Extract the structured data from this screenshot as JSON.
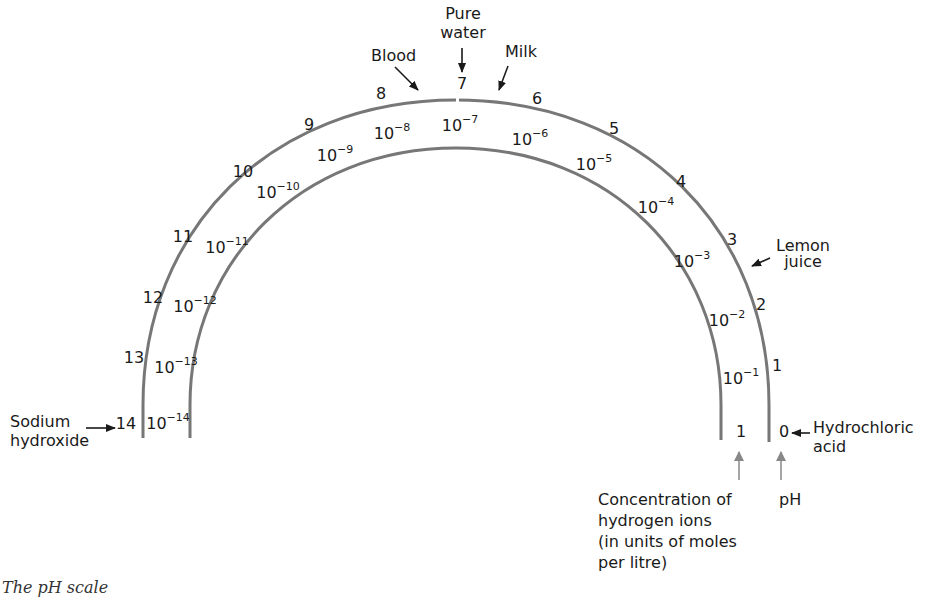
{
  "diagram": {
    "title_caption": "The pH scale",
    "scale_colors": {
      "arc": "#777777",
      "text": "#1a1a1a",
      "pointer_arrow": "#1a1a1a",
      "axis_arrow": "#888888"
    },
    "ph_scale": [
      {
        "ph": "14",
        "x": 126,
        "y": 424
      },
      {
        "ph": "13",
        "x": 134,
        "y": 358
      },
      {
        "ph": "12",
        "x": 153,
        "y": 298
      },
      {
        "ph": "11",
        "x": 183,
        "y": 237
      },
      {
        "ph": "10",
        "x": 243,
        "y": 172
      },
      {
        "ph": "9",
        "x": 309,
        "y": 125
      },
      {
        "ph": "8",
        "x": 381,
        "y": 94
      },
      {
        "ph": "7",
        "x": 462,
        "y": 84
      },
      {
        "ph": "6",
        "x": 537,
        "y": 99
      },
      {
        "ph": "5",
        "x": 614,
        "y": 129
      },
      {
        "ph": "4",
        "x": 681,
        "y": 182
      },
      {
        "ph": "3",
        "x": 732,
        "y": 240
      },
      {
        "ph": "2",
        "x": 761,
        "y": 305
      },
      {
        "ph": "1",
        "x": 777,
        "y": 366
      },
      {
        "ph": "0",
        "x": 784,
        "y": 432
      }
    ],
    "concentration_scale": [
      {
        "base": "10",
        "exp": "−14",
        "x": 168,
        "y": 422
      },
      {
        "base": "10",
        "exp": "−13",
        "x": 176,
        "y": 368
      },
      {
        "base": "10",
        "exp": "−12",
        "x": 195,
        "y": 306
      },
      {
        "base": "10",
        "exp": "−11",
        "x": 226,
        "y": 247
      },
      {
        "base": "10",
        "exp": "−10",
        "x": 277,
        "y": 192
      },
      {
        "base": "10",
        "exp": "−9",
        "x": 335,
        "y": 155
      },
      {
        "base": "10",
        "exp": "−8",
        "x": 392,
        "y": 133
      },
      {
        "base": "10",
        "exp": "−7",
        "x": 460,
        "y": 125
      },
      {
        "base": "10",
        "exp": "−6",
        "x": 530,
        "y": 139
      },
      {
        "base": "10",
        "exp": "−5",
        "x": 594,
        "y": 164
      },
      {
        "base": "10",
        "exp": "−4",
        "x": 656,
        "y": 207
      },
      {
        "base": "10",
        "exp": "−3",
        "x": 692,
        "y": 261
      },
      {
        "base": "10",
        "exp": "−2",
        "x": 727,
        "y": 320
      },
      {
        "base": "10",
        "exp": "−1",
        "x": 741,
        "y": 378
      },
      {
        "base": "1",
        "exp": "",
        "x": 741,
        "y": 432
      }
    ],
    "substances": {
      "sodium_hydroxide": {
        "line1": "Sodium",
        "line2": "hydroxide"
      },
      "blood": "Blood",
      "pure_water": {
        "line1": "Pure",
        "line2": "water"
      },
      "milk": "Milk",
      "lemon_juice": {
        "line1": "Lemon",
        "line2": "juice"
      },
      "hydrochloric_acid": {
        "line1": "Hydrochloric",
        "line2": "acid"
      }
    },
    "axis_labels": {
      "concentration": {
        "line1": "Concentration of",
        "line2": "hydrogen ions",
        "line3": "(in units of moles",
        "line4": "per litre)"
      },
      "ph": "pH"
    }
  }
}
